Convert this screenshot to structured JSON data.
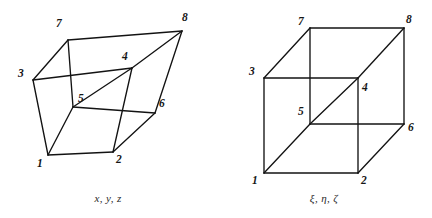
{
  "figures": [
    {
      "id": "distorted-hexahedron",
      "caption": "x, y, z",
      "vertex_labels": [
        "1",
        "2",
        "3",
        "4",
        "5",
        "6",
        "7",
        "8"
      ],
      "vertices": {
        "1": [
          48,
          155
        ],
        "2": [
          113,
          152
        ],
        "3": [
          33,
          80
        ],
        "4": [
          132,
          68
        ],
        "5": [
          73,
          107
        ],
        "6": [
          155,
          113
        ],
        "7": [
          68,
          40
        ],
        "8": [
          182,
          31
        ]
      },
      "label_positions": {
        "1": [
          37,
          158
        ],
        "2": [
          116,
          154
        ],
        "3": [
          18,
          68
        ],
        "4": [
          122,
          51
        ],
        "5": [
          78,
          93
        ],
        "6": [
          159,
          98
        ],
        "7": [
          56,
          18
        ],
        "8": [
          182,
          12
        ]
      },
      "edges": [
        [
          "1",
          "2"
        ],
        [
          "2",
          "6"
        ],
        [
          "6",
          "8"
        ],
        [
          "8",
          "7"
        ],
        [
          "7",
          "3"
        ],
        [
          "3",
          "1"
        ],
        [
          "1",
          "5"
        ],
        [
          "5",
          "7"
        ],
        [
          "3",
          "4"
        ],
        [
          "4",
          "8"
        ],
        [
          "5",
          "4"
        ],
        [
          "5",
          "6"
        ],
        [
          "2",
          "4"
        ]
      ]
    },
    {
      "id": "reference-cube",
      "caption": "ξ, η, ζ",
      "vertex_labels": [
        "1",
        "2",
        "3",
        "4",
        "5",
        "6",
        "7",
        "8"
      ],
      "vertices": {
        "1": [
          48,
          173
        ],
        "2": [
          142,
          173
        ],
        "3": [
          48,
          78
        ],
        "4": [
          142,
          78
        ],
        "5": [
          94,
          124
        ],
        "6": [
          188,
          124
        ],
        "7": [
          94,
          28
        ],
        "8": [
          188,
          28
        ]
      },
      "label_positions": {
        "1": [
          36,
          175
        ],
        "2": [
          145,
          175
        ],
        "3": [
          33,
          66
        ],
        "4": [
          146,
          82
        ],
        "5": [
          82,
          106
        ],
        "6": [
          192,
          122
        ],
        "7": [
          82,
          16
        ],
        "8": [
          190,
          14
        ]
      },
      "edges": [
        [
          "1",
          "2"
        ],
        [
          "2",
          "6"
        ],
        [
          "6",
          "8"
        ],
        [
          "8",
          "7"
        ],
        [
          "7",
          "3"
        ],
        [
          "3",
          "1"
        ],
        [
          "1",
          "5"
        ],
        [
          "5",
          "7"
        ],
        [
          "3",
          "4"
        ],
        [
          "4",
          "8"
        ],
        [
          "5",
          "4"
        ],
        [
          "5",
          "6"
        ],
        [
          "2",
          "4"
        ]
      ]
    }
  ],
  "colors": {
    "stroke": "#131313",
    "background": "#ffffff",
    "label": "#161616"
  }
}
